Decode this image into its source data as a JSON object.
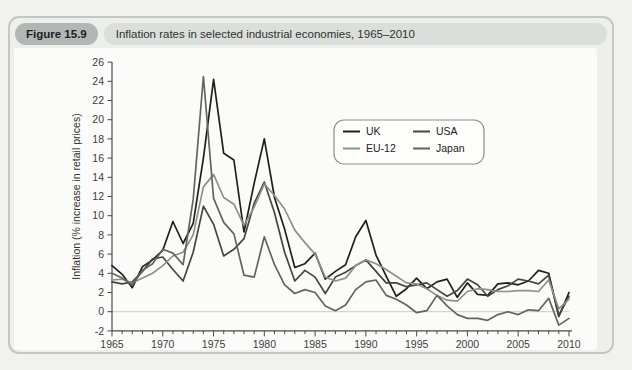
{
  "figure": {
    "label": "Figure 15.9",
    "title": "Inflation rates in selected industrial economies, 1965–2010"
  },
  "chart_data": {
    "type": "line",
    "title": "Inflation rates in selected industrial economies, 1965–2010",
    "xlabel": "",
    "ylabel": "Inflation (% increase in retail prices)",
    "xlim": [
      1965,
      2010
    ],
    "ylim": [
      -2,
      26
    ],
    "y_tick_step": 2,
    "x_major_ticks": [
      1965,
      1970,
      1975,
      1980,
      1985,
      1990,
      1995,
      2000,
      2005,
      2010
    ],
    "x_minor_tick_step": 1,
    "grid": "zero-line-only",
    "legend_position": "upper-middle",
    "legend_columns": 2,
    "legend_order": [
      "UK",
      "USA",
      "EU-12",
      "Japan"
    ],
    "x": [
      1965,
      1966,
      1967,
      1968,
      1969,
      1970,
      1971,
      1972,
      1973,
      1974,
      1975,
      1976,
      1977,
      1978,
      1979,
      1980,
      1981,
      1982,
      1983,
      1984,
      1985,
      1986,
      1987,
      1988,
      1989,
      1990,
      1991,
      1992,
      1993,
      1994,
      1995,
      1996,
      1997,
      1998,
      1999,
      2000,
      2001,
      2002,
      2003,
      2004,
      2005,
      2006,
      2007,
      2008,
      2009,
      2010
    ],
    "series": [
      {
        "name": "UK",
        "color": "#1f1f1f",
        "values": [
          4.8,
          3.9,
          2.5,
          4.7,
          5.4,
          6.4,
          9.4,
          7.1,
          9.2,
          16.0,
          24.2,
          16.5,
          15.8,
          8.3,
          13.4,
          18.0,
          11.9,
          8.6,
          4.6,
          5.0,
          6.1,
          3.4,
          4.2,
          4.9,
          7.8,
          9.5,
          5.9,
          3.7,
          1.6,
          2.4,
          3.5,
          2.4,
          3.1,
          3.4,
          1.5,
          3.0,
          1.8,
          1.7,
          2.9,
          3.0,
          2.8,
          3.2,
          4.3,
          4.0,
          -0.5,
          2.0
        ]
      },
      {
        "name": "USA",
        "color": "#454545",
        "values": [
          3.1,
          2.9,
          3.1,
          4.2,
          5.5,
          5.7,
          4.4,
          3.2,
          6.2,
          11.0,
          9.1,
          5.8,
          6.5,
          7.6,
          11.3,
          13.5,
          10.3,
          6.2,
          3.2,
          4.3,
          3.6,
          1.9,
          3.6,
          4.1,
          4.8,
          5.4,
          4.2,
          3.0,
          3.0,
          2.6,
          2.8,
          3.0,
          2.3,
          1.6,
          2.2,
          3.4,
          2.8,
          1.6,
          2.3,
          2.7,
          3.4,
          3.2,
          2.9,
          3.8,
          -0.4,
          1.6
        ]
      },
      {
        "name": "EU-12",
        "color": "#8f8f8f",
        "values": [
          3.3,
          3.4,
          3.0,
          3.5,
          4.0,
          4.8,
          5.8,
          6.2,
          8.0,
          13.0,
          14.3,
          11.9,
          11.2,
          9.0,
          10.9,
          13.3,
          12.1,
          10.7,
          8.5,
          7.2,
          6.0,
          3.6,
          3.2,
          3.5,
          4.8,
          5.4,
          5.0,
          4.4,
          3.7,
          3.0,
          2.9,
          2.4,
          1.7,
          1.2,
          1.1,
          2.1,
          2.4,
          2.3,
          2.1,
          2.1,
          2.2,
          2.2,
          2.1,
          3.3,
          0.3,
          1.3
        ]
      },
      {
        "name": "Japan",
        "color": "#636363",
        "values": [
          4.0,
          3.5,
          2.8,
          4.3,
          5.0,
          6.5,
          6.1,
          4.9,
          11.7,
          24.5,
          11.8,
          9.3,
          8.1,
          3.8,
          3.6,
          7.8,
          4.9,
          2.8,
          1.9,
          2.3,
          2.0,
          0.6,
          0.1,
          0.7,
          2.3,
          3.1,
          3.3,
          1.7,
          1.3,
          0.7,
          -0.1,
          0.1,
          1.7,
          0.6,
          -0.3,
          -0.7,
          -0.7,
          -0.9,
          -0.3,
          0.0,
          -0.3,
          0.2,
          0.1,
          1.4,
          -1.4,
          -0.7
        ]
      }
    ],
    "colors": {
      "axis": "#4a4a4a",
      "tick_label": "#3c3c3c",
      "zero_line": "#c9ccc8",
      "legend_border": "#8a8e8c",
      "legend_bg": "#fdfdfc"
    }
  }
}
